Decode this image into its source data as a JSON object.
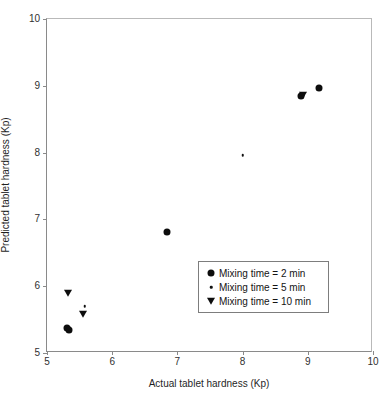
{
  "chart_data": {
    "type": "scatter",
    "title": "",
    "xlabel": "Actual tablet hardness (Kp)",
    "ylabel": "Predicted tablet hardness (Kp)",
    "xlim": [
      5,
      10
    ],
    "ylim": [
      5,
      10
    ],
    "xticks": [
      "5",
      "6",
      "7",
      "8",
      "9",
      "10"
    ],
    "yticks": [
      "5",
      "6",
      "7",
      "8",
      "9",
      "10"
    ],
    "grid": false,
    "legend_position": "inside-lower-right",
    "series": [
      {
        "name": "Mixing time = 2 min",
        "marker": "filled-circle",
        "color": "#0d0d0d",
        "points": [
          {
            "x": 5.31,
            "y": 5.38
          },
          {
            "x": 5.34,
            "y": 5.35
          },
          {
            "x": 6.84,
            "y": 6.81
          },
          {
            "x": 8.9,
            "y": 8.85
          },
          {
            "x": 9.17,
            "y": 8.97
          }
        ]
      },
      {
        "name": "Mixing time = 5 min",
        "marker": "small-dot",
        "color": "#111111",
        "points": [
          {
            "x": 5.58,
            "y": 5.7
          },
          {
            "x": 8.0,
            "y": 7.96
          },
          {
            "x": 8.93,
            "y": 8.87
          }
        ]
      },
      {
        "name": "Mixing time = 10 min",
        "marker": "filled-down-triangle",
        "color": "#0d0d0d",
        "points": [
          {
            "x": 5.32,
            "y": 5.9
          },
          {
            "x": 5.55,
            "y": 5.58
          },
          {
            "x": 8.92,
            "y": 8.86
          }
        ]
      }
    ],
    "legend": [
      {
        "label": "Mixing time = 2 min",
        "marker": "filled-circle"
      },
      {
        "label": "Mixing time = 5 min",
        "marker": "small-dot"
      },
      {
        "label": "Mixing time = 10 min",
        "marker": "filled-down-triangle"
      }
    ]
  }
}
